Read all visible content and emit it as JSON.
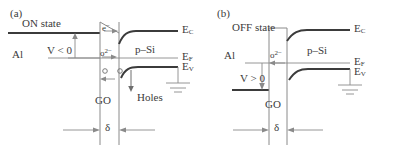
{
  "figure": {
    "type": "two-panel-energy-band-diagram",
    "line_color": "#3b3b3b",
    "thin_line_color": "#8a8a8a"
  },
  "panels": [
    {
      "tag": "(a)",
      "state_label": "ON state",
      "electrode_label": "Al",
      "bias_label": "V < 0",
      "barrier_label": "GO",
      "thickness_label": "δ",
      "semiconductor_label": "p–Si",
      "carrier_labels": {
        "electron": "e",
        "electron_charge": "−",
        "oxygen_ion": "o",
        "oxygen_charge": "2−",
        "holes": "Holes"
      },
      "band_labels": [
        {
          "symbol": "E",
          "sub": "C"
        },
        {
          "symbol": "E",
          "sub": "F"
        },
        {
          "symbol": "E",
          "sub": "V"
        }
      ],
      "ground_symbol": "earth-ground"
    },
    {
      "tag": "(b)",
      "state_label": "OFF state",
      "electrode_label": "Al",
      "bias_label": "V > 0",
      "barrier_label": "GO",
      "thickness_label": "δ",
      "semiconductor_label": "p–Si",
      "carrier_labels": {
        "oxygen_ion": "o",
        "oxygen_charge": "2−"
      },
      "band_labels": [
        {
          "symbol": "E",
          "sub": "C"
        },
        {
          "symbol": "E",
          "sub": "F"
        },
        {
          "symbol": "E",
          "sub": "V"
        }
      ],
      "ground_symbol": "earth-ground"
    }
  ]
}
